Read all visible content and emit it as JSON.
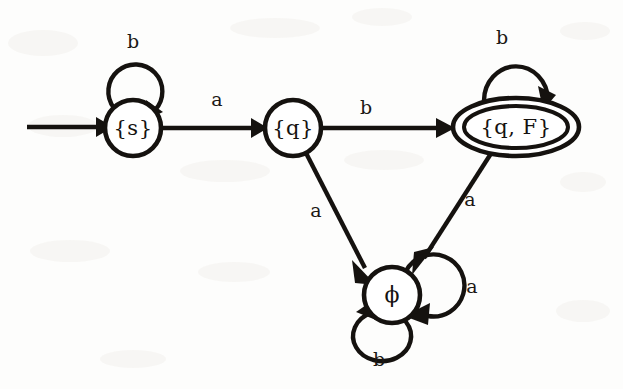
{
  "diagram": {
    "type": "state-transition-diagram",
    "background_color": "#fdfdfc",
    "ink_color": "#15120f",
    "alphabet": [
      "a",
      "b"
    ],
    "start_state": "{s}",
    "accepting_states": [
      "{q, F}"
    ],
    "states": [
      {
        "id": "s",
        "label": "{s}",
        "shape": "circle",
        "accepting": false,
        "start": true,
        "cx": 133,
        "cy": 128,
        "r": 28
      },
      {
        "id": "q",
        "label": "{q}",
        "shape": "circle",
        "accepting": false,
        "start": false,
        "cx": 293,
        "cy": 128,
        "r": 28
      },
      {
        "id": "qF",
        "label": "{q, F}",
        "shape": "double-ellipse",
        "accepting": true,
        "start": false,
        "cx": 516,
        "cy": 127,
        "rx": 63,
        "ry": 29
      },
      {
        "id": "phi",
        "label": "ϕ",
        "shape": "circle",
        "accepting": false,
        "start": false,
        "cx": 392,
        "cy": 295,
        "r": 28
      }
    ],
    "transitions": [
      {
        "from": "start",
        "to": "s",
        "label": "",
        "kind": "start-arrow"
      },
      {
        "from": "s",
        "to": "s",
        "label": "b",
        "kind": "self-loop-top",
        "label_x": 133,
        "label_y": 43
      },
      {
        "from": "s",
        "to": "q",
        "label": "a",
        "kind": "straight",
        "label_x": 217,
        "label_y": 101
      },
      {
        "from": "q",
        "to": "qF",
        "label": "b",
        "kind": "straight",
        "label_x": 366,
        "label_y": 109
      },
      {
        "from": "qF",
        "to": "qF",
        "label": "b",
        "kind": "self-loop-top",
        "label_x": 502,
        "label_y": 39
      },
      {
        "from": "q",
        "to": "phi",
        "label": "a",
        "kind": "straight",
        "label_x": 316,
        "label_y": 212
      },
      {
        "from": "qF",
        "to": "phi",
        "label": "a",
        "kind": "straight",
        "label_x": 470,
        "label_y": 201
      },
      {
        "from": "phi",
        "to": "phi",
        "label": "a",
        "kind": "self-loop-right",
        "label_x": 472,
        "label_y": 288
      },
      {
        "from": "phi",
        "to": "phi",
        "label": "b",
        "kind": "self-loop-bottom",
        "label_x": 379,
        "label_y": 361
      }
    ],
    "labels": {
      "state_s": "{s}",
      "state_q": "{q}",
      "state_qF": "{q, F}",
      "state_phi": "ϕ",
      "loop_s_b": "b",
      "edge_s_q_a": "a",
      "edge_q_qF_b": "b",
      "loop_qF_b": "b",
      "edge_q_phi_a": "a",
      "edge_qF_phi_a": "a",
      "loop_phi_a": "a",
      "loop_phi_b": "b"
    }
  }
}
